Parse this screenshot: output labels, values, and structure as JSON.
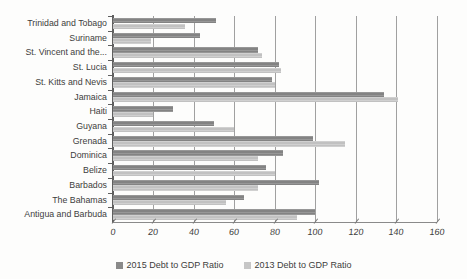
{
  "chart": {
    "background_color": "#fdfdfc",
    "text_color": "#3d3d3d",
    "axis_color": "#5f5f5f",
    "gridline_color": "#8f8f8f"
  },
  "chart_data": {
    "type": "bar",
    "orientation": "horizontal",
    "title": "",
    "categories": [
      "Trinidad and Tobago",
      "Suriname",
      "St. Vincent and the...",
      "St. Lucia",
      "St. Kitts and Nevis",
      "Jamaica",
      "Haiti",
      "Guyana",
      "Grenada",
      "Dominica",
      "Belize",
      "Barbados",
      "The Bahamas",
      "Antigua and Barbuda"
    ],
    "series": [
      {
        "name": "2015 Debt to GDP Ratio",
        "color": "#8a8a8a",
        "values": [
          51,
          43,
          72,
          82,
          79,
          134,
          30,
          50,
          99,
          84,
          76,
          102,
          65,
          100
        ]
      },
      {
        "name": "2013 Debt to GDP Ratio",
        "color": "#c6c6c6",
        "values": [
          36,
          19,
          74,
          83,
          80,
          141,
          20,
          60,
          115,
          72,
          80,
          72,
          56,
          91
        ]
      }
    ],
    "x_axis": {
      "min": 0,
      "max": 160,
      "tick_interval": 20,
      "tick_labels": [
        "0",
        "20",
        "40",
        "60",
        "80",
        "100",
        "120",
        "140",
        "160"
      ]
    },
    "y_axis": {
      "label": ""
    },
    "legend": {
      "position": "bottom",
      "entries": [
        "2015 Debt to GDP Ratio",
        "2013 Debt to GDP Ratio"
      ]
    },
    "grid": true
  }
}
